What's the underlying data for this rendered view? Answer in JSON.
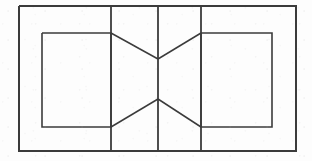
{
  "figure": {
    "canvas": {
      "width": 312,
      "height": 161,
      "background_color": "#fdfdfd"
    },
    "style": {
      "stroke_color": "#3b3b3b",
      "stroke_width_outer": 2.0,
      "stroke_width_inner": 1.6,
      "stroke_width_vertical": 1.8,
      "stroke_width_diagonal": 1.5
    },
    "shapes": {
      "outer_rectangle": {
        "name": "outer-rectangle",
        "x": 19,
        "y": 6,
        "width": 277,
        "height": 145,
        "points": "19,6 296,6 296,151 19,151 19,6"
      },
      "left_inner_rectangle": {
        "name": "left-inner-rectangle",
        "x": 42,
        "y": 33,
        "width": 69,
        "height": 94,
        "points": "42,33 111,33 111,127 42,127 42,33"
      },
      "right_inner_rectangle": {
        "name": "right-inner-rectangle",
        "x": 201,
        "y": 33,
        "width": 71,
        "height": 94,
        "points": "201,33 272,33 272,127 201,127 201,33"
      },
      "vertical_line_left": {
        "name": "vertical-divider-left",
        "x": 111,
        "y1": 6,
        "y2": 151,
        "points": "111,6 111,151"
      },
      "vertical_line_center": {
        "name": "vertical-divider-center",
        "x": 158,
        "y1": 6,
        "y2": 151,
        "points": "158,6 158,151"
      },
      "vertical_line_right": {
        "name": "vertical-divider-right",
        "x": 201,
        "y1": 6,
        "y2": 151,
        "points": "201,6 201,151"
      },
      "diagonal_top_left": {
        "name": "diagonal-top-left",
        "points": "111,33 158,59"
      },
      "diagonal_top_right": {
        "name": "diagonal-top-right",
        "points": "158,59 201,33"
      },
      "diagonal_bottom_left": {
        "name": "diagonal-bottom-left",
        "points": "111,127 158,99"
      },
      "diagonal_bottom_right": {
        "name": "diagonal-bottom-right",
        "points": "158,99 201,127"
      }
    },
    "vertices": {
      "bowtie_upper": {
        "x": 158,
        "y": 59
      },
      "bowtie_lower": {
        "x": 158,
        "y": 99
      }
    }
  }
}
